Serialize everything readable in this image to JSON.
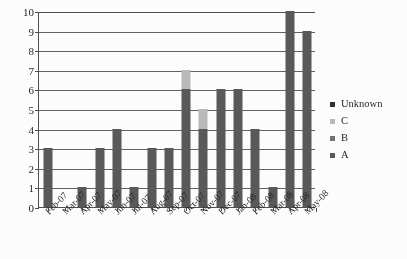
{
  "chart_data": {
    "type": "bar",
    "title": "",
    "subtitle": "",
    "xlabel": "",
    "ylabel": "",
    "stacked": true,
    "grid": true,
    "legend_position": "right",
    "ylim": [
      0,
      10
    ],
    "ytick_step": 1,
    "yticks": [
      "0",
      "1",
      "2",
      "3",
      "4",
      "5",
      "6",
      "7",
      "8",
      "9",
      "10"
    ],
    "categories": [
      "Feb-07",
      "Mar-07",
      "Apr-07",
      "May-07",
      "Jun-07",
      "Jul-07",
      "Aug-07",
      "Sep-07",
      "Oct-07",
      "Nov-07",
      "Dec-07",
      "Jan-08",
      "Feb-08",
      "Mar-08",
      "Apr-08",
      "May-08"
    ],
    "series": [
      {
        "name": "A",
        "color": "#555555",
        "values": [
          3,
          0,
          1,
          3,
          4,
          1,
          3,
          3,
          6,
          4,
          6,
          6,
          4,
          1,
          10,
          9
        ]
      },
      {
        "name": "B",
        "color": "#6e6e6e",
        "values": [
          0,
          0,
          0,
          0,
          0,
          0,
          0,
          0,
          0,
          0,
          0,
          0,
          0,
          0,
          0,
          0
        ]
      },
      {
        "name": "C",
        "color": "#b9b9b9",
        "values": [
          0,
          0,
          0,
          0,
          0,
          0,
          0,
          0,
          1,
          1,
          0,
          0,
          0,
          0,
          0,
          0
        ]
      },
      {
        "name": "Unknown",
        "color": "#2b2b2b",
        "values": [
          0,
          0,
          0,
          0,
          0,
          0,
          0,
          0,
          0,
          0,
          0,
          0,
          0,
          0,
          0,
          0
        ]
      }
    ],
    "totals": [
      3,
      0,
      1,
      3,
      4,
      1,
      3,
      3,
      7,
      5,
      6,
      6,
      4,
      1,
      10,
      9
    ]
  },
  "legend": {
    "entries": [
      {
        "label": "Unknown",
        "color": "#2b2b2b"
      },
      {
        "label": "C",
        "color": "#b9b9b9"
      },
      {
        "label": "B",
        "color": "#6e6e6e"
      },
      {
        "label": "A",
        "color": "#555555"
      }
    ]
  }
}
